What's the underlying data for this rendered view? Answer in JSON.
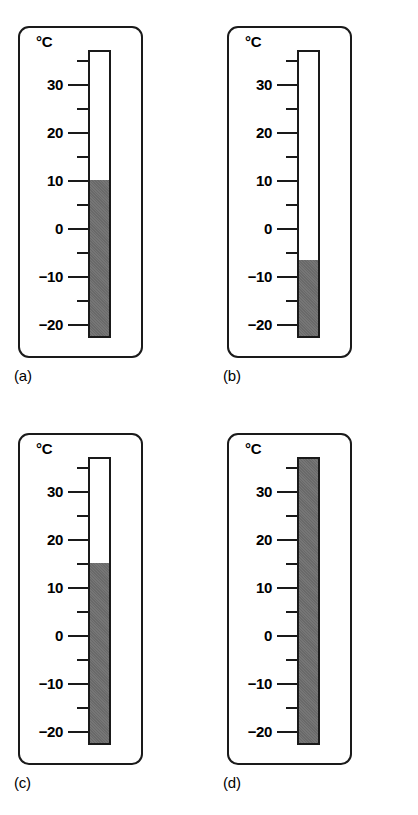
{
  "figure": {
    "unit_label": "°C",
    "scale": {
      "min": -23,
      "max": 37,
      "major_step": 10,
      "minor_step": 5,
      "major_ticks": [
        30,
        20,
        10,
        0,
        -10,
        -20
      ],
      "major_tick_labels": [
        "30",
        "20",
        "10",
        "0",
        "−10",
        "−20"
      ],
      "minor_ticks": [
        35,
        25,
        15,
        5,
        -5,
        -15
      ],
      "ink_color": "#1a1a1a",
      "fill_color": "#6e6e6e",
      "background_color": "#ffffff"
    },
    "panels": [
      {
        "id": "a",
        "caption": "(a)",
        "unit_label": "°C",
        "reading": 10,
        "reading_text": "10 °C"
      },
      {
        "id": "b",
        "caption": "(b)",
        "unit_label": "°C",
        "reading": -7,
        "reading_text": "−7 °C"
      },
      {
        "id": "c",
        "caption": "(c)",
        "unit_label": "°C",
        "reading": 15,
        "reading_text": "15 °C"
      },
      {
        "id": "d",
        "caption": "(d)",
        "unit_label": "°C",
        "reading": 37,
        "reading_text": "37 °C"
      }
    ]
  },
  "chart_data": {
    "type": "bar",
    "title": "",
    "xlabel": "",
    "ylabel": "°C",
    "ylim": [
      -23,
      37
    ],
    "grid": false,
    "legend": null,
    "categories": [
      "(a)",
      "(b)",
      "(c)",
      "(d)"
    ],
    "values": [
      10,
      -7,
      15,
      37
    ],
    "tick_labels": [
      "30",
      "20",
      "10",
      "0",
      "−10",
      "−20"
    ],
    "tick_values": [
      30,
      20,
      10,
      0,
      -10,
      -20
    ],
    "minor_tick_values": [
      35,
      25,
      15,
      5,
      -5,
      -15
    ],
    "annotations": [
      "°C",
      "°C",
      "°C",
      "°C"
    ]
  }
}
